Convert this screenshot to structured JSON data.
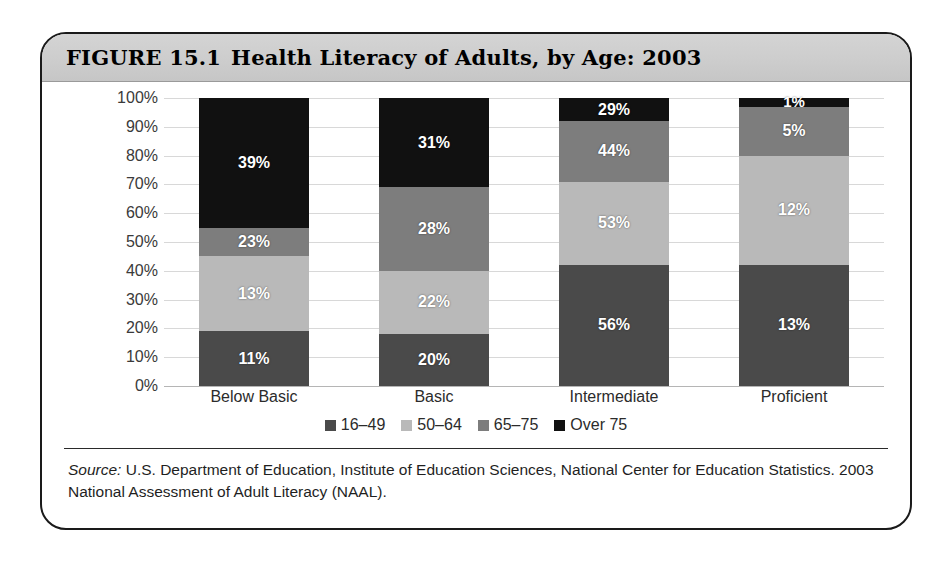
{
  "figure": {
    "number": "FIGURE 15.1",
    "title": "Health Literacy of Adults, by Age: 2003"
  },
  "source": {
    "label": "Source:",
    "text": " U.S. Department of Education, Institute of Education Sciences, National Center for Education Statistics. 2003 National Assessment of Adult Literacy (NAAL)."
  },
  "colors": {
    "age_16_49": "#4a4a4a",
    "age_50_64": "#b9b9b9",
    "age_65_75": "#7d7d7d",
    "over_75": "#111111",
    "gridline": "#d8d8d8",
    "header_band": "#cdcdcd",
    "frame": "#1a1a1a"
  },
  "chart_data": {
    "type": "bar",
    "subtype": "stacked-100-percent",
    "title": "Health Literacy of Adults, by Age: 2003",
    "xlabel": "",
    "ylabel": "",
    "ylim": [
      0,
      100
    ],
    "grid": true,
    "legend_position": "bottom",
    "categories": [
      "Below Basic",
      "Basic",
      "Intermediate",
      "Proficient"
    ],
    "tick_labels": [
      "0%",
      "10%",
      "20%",
      "30%",
      "40%",
      "50%",
      "60%",
      "70%",
      "80%",
      "90%",
      "100%"
    ],
    "ticks": [
      0,
      10,
      20,
      30,
      40,
      50,
      60,
      70,
      80,
      90,
      100
    ],
    "series": [
      {
        "name": "16–49",
        "color": "#4a4a4a",
        "values": [
          11,
          20,
          56,
          13
        ],
        "labels": [
          "11%",
          "20%",
          "56%",
          "13%"
        ],
        "stack_fraction": [
          19,
          18,
          42,
          42
        ]
      },
      {
        "name": "50–64",
        "color": "#b9b9b9",
        "values": [
          13,
          22,
          53,
          12
        ],
        "labels": [
          "13%",
          "22%",
          "53%",
          "12%"
        ],
        "stack_fraction": [
          26,
          22,
          29,
          38
        ]
      },
      {
        "name": "65–75",
        "color": "#7d7d7d",
        "values": [
          23,
          28,
          44,
          5
        ],
        "labels": [
          "23%",
          "28%",
          "44%",
          "5%"
        ],
        "stack_fraction": [
          10,
          29,
          21,
          17
        ]
      },
      {
        "name": "Over 75",
        "color": "#111111",
        "values": [
          39,
          31,
          29,
          1
        ],
        "labels": [
          "39%",
          "31%",
          "29%",
          "1%"
        ],
        "stack_fraction": [
          45,
          31,
          8,
          3
        ]
      }
    ]
  },
  "legend": [
    {
      "label": "16–49",
      "color": "#4a4a4a"
    },
    {
      "label": "50–64",
      "color": "#b9b9b9"
    },
    {
      "label": "65–75",
      "color": "#7d7d7d"
    },
    {
      "label": "Over 75",
      "color": "#111111"
    }
  ]
}
